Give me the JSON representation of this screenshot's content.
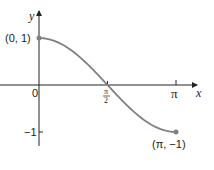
{
  "chart_data": {
    "type": "line",
    "title": "",
    "function": "y = cos(x)",
    "xlabel": "x",
    "ylabel": "y",
    "xlim": [
      0,
      3.3
    ],
    "ylim": [
      -1.7,
      1.65
    ],
    "x_ticks": [
      {
        "value": 0,
        "label": "0"
      },
      {
        "value": 1.5708,
        "label": "π/2"
      },
      {
        "value": 3.1416,
        "label": "π"
      }
    ],
    "y_ticks": [
      {
        "value": -1,
        "label": "−1"
      }
    ],
    "series": [
      {
        "name": "cos(x) on [0, π]",
        "x": [
          0,
          0.3927,
          0.7854,
          1.1781,
          1.5708,
          1.9635,
          2.3562,
          2.7489,
          3.1416
        ],
        "y": [
          1,
          0.9239,
          0.7071,
          0.3827,
          0,
          -0.3827,
          -0.7071,
          -0.9239,
          -1
        ],
        "color": "#808080"
      }
    ],
    "annotations": [
      {
        "x": 0,
        "y": 1,
        "label": "(0, 1)"
      },
      {
        "x": 3.1416,
        "y": -1,
        "label": "(π, −1)"
      }
    ],
    "grid": false,
    "legend": null
  },
  "labels": {
    "x_axis": "x",
    "y_axis": "y",
    "origin": "0",
    "pi_half_num": "π",
    "pi_half_den": "2",
    "pi": "π",
    "neg_one": "−1",
    "start_point": "(0, 1)",
    "end_point": "(π, −1)"
  },
  "colors": {
    "curve": "#808080",
    "axis": "#222222",
    "point": "#808080"
  }
}
